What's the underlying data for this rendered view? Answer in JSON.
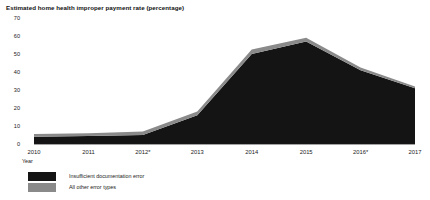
{
  "chart_data": {
    "type": "area",
    "stacked": true,
    "title": "Estimated home health improper payment rate (percentage)",
    "xlabel": "Year",
    "ylabel": "",
    "categories": [
      "2010",
      "2011",
      "2012*",
      "2013",
      "2014",
      "2015",
      "2016*",
      "2017"
    ],
    "series": [
      {
        "name": "Insufficient documentation error",
        "color": "#141414",
        "values": [
          4,
          4.5,
          5,
          16,
          50,
          57,
          41,
          31
        ]
      },
      {
        "name": "All other error types",
        "color": "#8a8a8a",
        "values": [
          1.5,
          1.5,
          2,
          2,
          2.5,
          2,
          1.5,
          1
        ]
      }
    ],
    "totals": [
      5.5,
      6,
      7,
      18,
      52.5,
      59,
      42.5,
      32
    ],
    "ylim": [
      0,
      70
    ],
    "yticks": [
      0,
      10,
      20,
      30,
      40,
      50,
      60,
      70
    ],
    "grid": false,
    "legend_position": "bottom-left"
  },
  "legend": {
    "items": [
      {
        "label": "Insufficient documentation error",
        "color": "#141414"
      },
      {
        "label": "All other error types",
        "color": "#8a8a8a"
      }
    ]
  }
}
